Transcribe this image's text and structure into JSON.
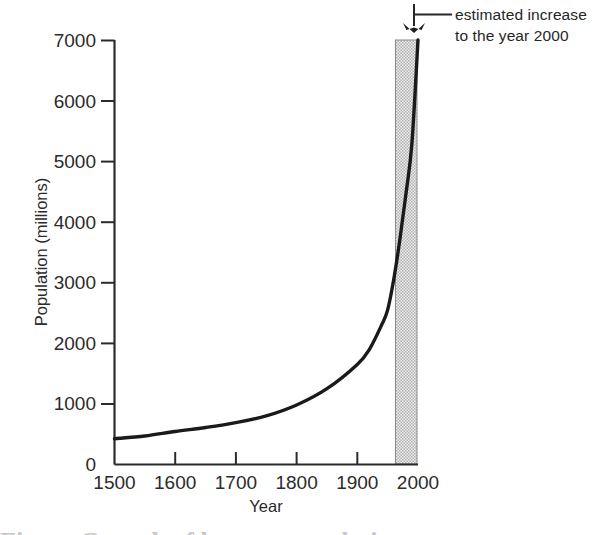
{
  "figure": {
    "caption_sliver": "Figure  Growth of human population"
  },
  "annotation": {
    "line1": "estimated increase",
    "line2": "to the year 2000",
    "pointer_icon": "double-arrow-down-icon",
    "leader_icon": "leader-line-icon"
  },
  "chart_data": {
    "type": "line",
    "title": "",
    "xlabel": "Year",
    "ylabel": "Population (millions)",
    "xlim": [
      1500,
      2000
    ],
    "ylim": [
      0,
      7000
    ],
    "xticks": [
      1500,
      1600,
      1700,
      1800,
      1900,
      2000
    ],
    "xticklabels": [
      "1500",
      "1600",
      "1700",
      "1800",
      "1900",
      "2000"
    ],
    "yticks": [
      0,
      1000,
      2000,
      3000,
      4000,
      5000,
      6000,
      7000
    ],
    "yticklabels": [
      "0",
      "1000",
      "2000",
      "3000",
      "4000",
      "5000",
      "6000",
      "7000"
    ],
    "grid": false,
    "legend": null,
    "series": [
      {
        "name": "World population",
        "x": [
          1500,
          1550,
          1600,
          1650,
          1700,
          1750,
          1800,
          1850,
          1900,
          1920,
          1940,
          1950,
          1960,
          1970,
          1980,
          1990,
          2000
        ],
        "values": [
          425,
          470,
          545,
          610,
          690,
          800,
          980,
          1250,
          1650,
          1900,
          2300,
          2550,
          3050,
          3700,
          4450,
          5300,
          7000
        ]
      }
    ],
    "shaded_region": {
      "label": "estimated increase to the year 2000",
      "x_start": 1980,
      "x_end": 2000,
      "fill": "#d9d9d9",
      "pattern": "stipple"
    },
    "line_color": "#1a1a1a",
    "line_width": 3.4
  }
}
